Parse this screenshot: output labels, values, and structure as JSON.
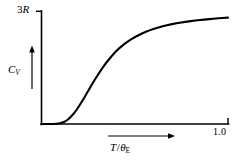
{
  "chart_data": {
    "type": "line",
    "title": "",
    "subtitle": "",
    "xlabel": "T/θE",
    "ylabel": "CV",
    "xlabel_parts": {
      "numerator": "T",
      "slash": "/",
      "denominator": "θ",
      "denominator_sub": "E"
    },
    "ylabel_parts": {
      "symbol": "C",
      "sub": "V"
    },
    "ylim": [
      0,
      1
    ],
    "xlim": [
      0,
      1
    ],
    "y_tick_labels": [
      "3R"
    ],
    "y_tick_values": [
      1
    ],
    "y_tick_label_parts": {
      "num": "3",
      "sym": "R"
    },
    "x_tick_labels": [
      "1.0"
    ],
    "x_tick_values": [
      1
    ],
    "grid": false,
    "legend": "none",
    "annotations": [
      {
        "name": "y-axis-direction-arrow",
        "direction": "up"
      },
      {
        "name": "x-axis-direction-arrow",
        "direction": "right"
      }
    ],
    "series": [
      {
        "name": "Einstein heat capacity",
        "x": [
          0.0,
          0.04,
          0.08,
          0.1,
          0.12,
          0.14,
          0.16,
          0.18,
          0.2,
          0.22,
          0.25,
          0.28,
          0.3,
          0.33,
          0.36,
          0.4,
          0.44,
          0.48,
          0.52,
          0.56,
          0.6,
          0.65,
          0.7,
          0.75,
          0.8,
          0.85,
          0.9,
          0.95,
          1.0
        ],
        "y": [
          0.0,
          0.0,
          0.002,
          0.007,
          0.018,
          0.038,
          0.068,
          0.107,
          0.155,
          0.208,
          0.293,
          0.377,
          0.43,
          0.505,
          0.57,
          0.645,
          0.704,
          0.751,
          0.788,
          0.818,
          0.842,
          0.867,
          0.886,
          0.901,
          0.913,
          0.923,
          0.931,
          0.938,
          0.944
        ]
      }
    ],
    "colors": {
      "curve": "#000000",
      "axis": "#000000",
      "background": "#ffffff",
      "text": "#000000"
    }
  }
}
